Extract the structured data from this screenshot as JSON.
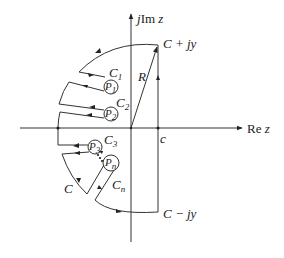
{
  "figure": {
    "axes": {
      "imag_label_j": "j",
      "imag_label_im": "Im",
      "imag_label_z": "z",
      "real_label_re": "Re",
      "real_label_z": "z"
    },
    "points": {
      "top": "C + jy",
      "bottom": "C − jy",
      "c": "c",
      "radius": "R"
    },
    "contours": [
      {
        "name": "C",
        "sub": "1"
      },
      {
        "name": "C",
        "sub": "2"
      },
      {
        "name": "C",
        "sub": "3"
      },
      {
        "name": "C",
        "sub": "n"
      }
    ],
    "poles": [
      {
        "name": "P",
        "sub": "1"
      },
      {
        "name": "P",
        "sub": "2"
      },
      {
        "name": "P",
        "sub": "3"
      },
      {
        "name": "P",
        "sub": "n"
      }
    ],
    "main_contour": "C"
  }
}
